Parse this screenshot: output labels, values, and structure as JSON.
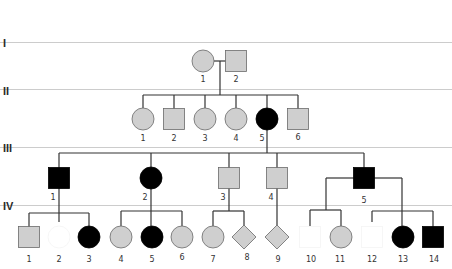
{
  "diagram": {
    "type": "pedigree",
    "colors": {
      "affected": "#000000",
      "unaffected_gray": "#cfcfcf",
      "unshaded": "#ffffff",
      "line": "#333333",
      "generation_divider": "#cccccc"
    },
    "generations": [
      {
        "label": "I",
        "y_label": 46,
        "divider_y": 42
      },
      {
        "label": "II",
        "y_label": 93,
        "divider_y": 89
      },
      {
        "label": "III",
        "y_label": 150,
        "divider_y": 147
      },
      {
        "label": "IV",
        "y_label": 209,
        "divider_y": 205
      }
    ],
    "individuals": [
      {
        "id": "I-1",
        "gen": "I",
        "num": "1",
        "sex": "female",
        "fill": "gray",
        "x": 203,
        "y": 61
      },
      {
        "id": "I-2",
        "gen": "I",
        "num": "2",
        "sex": "male",
        "fill": "gray",
        "x": 236,
        "y": 61
      },
      {
        "id": "II-1",
        "gen": "II",
        "num": "1",
        "sex": "female",
        "fill": "gray",
        "x": 143,
        "y": 119
      },
      {
        "id": "II-2",
        "gen": "II",
        "num": "2",
        "sex": "male",
        "fill": "gray",
        "x": 174,
        "y": 119
      },
      {
        "id": "II-3",
        "gen": "II",
        "num": "3",
        "sex": "female",
        "fill": "gray",
        "x": 205,
        "y": 119
      },
      {
        "id": "II-4",
        "gen": "II",
        "num": "4",
        "sex": "female",
        "fill": "gray",
        "x": 236,
        "y": 119
      },
      {
        "id": "II-5",
        "gen": "II",
        "num": "5",
        "sex": "female",
        "fill": "black",
        "x": 267,
        "y": 119
      },
      {
        "id": "II-6",
        "gen": "II",
        "num": "6",
        "sex": "male",
        "fill": "gray",
        "x": 298,
        "y": 119
      },
      {
        "id": "III-1",
        "gen": "III",
        "num": "1",
        "sex": "male",
        "fill": "black",
        "x": 59,
        "y": 178
      },
      {
        "id": "III-2",
        "gen": "III",
        "num": "2",
        "sex": "female",
        "fill": "black",
        "x": 151,
        "y": 178
      },
      {
        "id": "III-3",
        "gen": "III",
        "num": "3",
        "sex": "male",
        "fill": "gray",
        "x": 229,
        "y": 178
      },
      {
        "id": "III-4",
        "gen": "III",
        "num": "4",
        "sex": "male",
        "fill": "gray",
        "x": 277,
        "y": 178
      },
      {
        "id": "III-5",
        "gen": "III",
        "num": "5",
        "sex": "male",
        "fill": "black",
        "x": 364,
        "y": 178
      },
      {
        "id": "IV-1",
        "gen": "IV",
        "num": "1",
        "sex": "male",
        "fill": "gray",
        "x": 29,
        "y": 237
      },
      {
        "id": "IV-2",
        "gen": "IV",
        "num": "2",
        "sex": "female",
        "fill": "white",
        "x": 59,
        "y": 237
      },
      {
        "id": "IV-3",
        "gen": "IV",
        "num": "3",
        "sex": "female",
        "fill": "black",
        "x": 89,
        "y": 237
      },
      {
        "id": "IV-4",
        "gen": "IV",
        "num": "4",
        "sex": "female",
        "fill": "gray",
        "x": 121,
        "y": 237
      },
      {
        "id": "IV-5",
        "gen": "IV",
        "num": "5",
        "sex": "female",
        "fill": "black",
        "x": 152,
        "y": 237
      },
      {
        "id": "IV-6",
        "gen": "IV",
        "num": "6",
        "sex": "female",
        "fill": "gray",
        "x": 182,
        "y": 237
      },
      {
        "id": "IV-7",
        "gen": "IV",
        "num": "7",
        "sex": "female",
        "fill": "gray",
        "x": 213,
        "y": 237
      },
      {
        "id": "IV-8",
        "gen": "IV",
        "num": "8",
        "sex": "unknown",
        "fill": "gray",
        "x": 244,
        "y": 237
      },
      {
        "id": "IV-9",
        "gen": "IV",
        "num": "9",
        "sex": "unknown",
        "fill": "gray",
        "x": 277,
        "y": 237
      },
      {
        "id": "IV-10",
        "gen": "IV",
        "num": "10",
        "sex": "male",
        "fill": "white",
        "x": 310,
        "y": 237
      },
      {
        "id": "IV-11",
        "gen": "IV",
        "num": "11",
        "sex": "female",
        "fill": "gray",
        "x": 341,
        "y": 237
      },
      {
        "id": "IV-12",
        "gen": "IV",
        "num": "12",
        "sex": "male",
        "fill": "white",
        "x": 372,
        "y": 237
      },
      {
        "id": "IV-13",
        "gen": "IV",
        "num": "13",
        "sex": "female",
        "fill": "black",
        "x": 403,
        "y": 237
      },
      {
        "id": "IV-14",
        "gen": "IV",
        "num": "14",
        "sex": "male",
        "fill": "black",
        "x": 433,
        "y": 237
      }
    ],
    "labels": {
      "I-1": "1",
      "I-2": "2",
      "II-1": "1",
      "II-2": "2",
      "II-3": "3",
      "II-4": "4",
      "II-5": "5",
      "II-6": "6",
      "III-1": "1",
      "III-2": "2",
      "III-3": "3",
      "III-4": "4",
      "III-5": "5",
      "IV-1": "1",
      "IV-2": "2",
      "IV-3": "3",
      "IV-4": "4",
      "IV-5": "5",
      "IV-6": "6",
      "IV-7": "7",
      "IV-8": "8",
      "IV-9": "9",
      "IV-10": "10",
      "IV-11": "11",
      "IV-12": "12",
      "IV-13": "13",
      "IV-14": "14"
    }
  }
}
